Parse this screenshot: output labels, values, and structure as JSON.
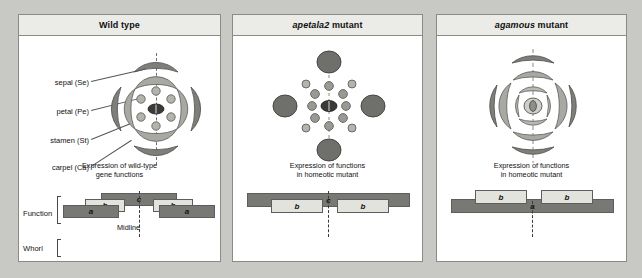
{
  "figure": {
    "background_color": "#c8c8c4",
    "panels": [
      {
        "id": "wild",
        "title_italic": "",
        "title_plain": "Wild type",
        "caption_line1": "Expression of wild-type",
        "caption_line2": "gene functions",
        "midline_label": "Midline",
        "row_labels": {
          "function": "Function",
          "whorl": "Whorl"
        },
        "organ_labels": [
          {
            "name": "sepal-label",
            "text": "sepal (Se)"
          },
          {
            "name": "petal-label",
            "text": "petal (Pe)"
          },
          {
            "name": "stamen-label",
            "text": "stamen (St)"
          },
          {
            "name": "carpel-label",
            "text": "carpel (Ca)"
          }
        ],
        "functions": [
          {
            "label": "a",
            "style": "dark"
          },
          {
            "label": "b",
            "style": "light"
          },
          {
            "label": "c",
            "style": "dark"
          },
          {
            "label": "b",
            "style": "light"
          },
          {
            "label": "a",
            "style": "dark"
          }
        ],
        "whorl_cells": [
          "Se",
          "Pe",
          "St",
          "Ca",
          "Ca",
          "St",
          "Pe",
          "Se"
        ],
        "whorl_numbers": [
          "1",
          "2",
          "3",
          "4",
          "4",
          "3",
          "2",
          "1"
        ]
      },
      {
        "id": "apetala2",
        "title_italic": "apetala2",
        "title_plain": "mutant",
        "caption_line1": "Expression of functions",
        "caption_line2": "in homeotic mutant",
        "midline_label": "",
        "row_labels": {
          "function": "",
          "whorl": ""
        },
        "organ_labels": [],
        "functions": [
          {
            "label": "b",
            "style": "light"
          },
          {
            "label": "c",
            "style": "dark"
          },
          {
            "label": "b",
            "style": "light"
          }
        ],
        "whorl_cells": [
          "Ca",
          "St",
          "St",
          "Ca",
          "Ca",
          "St",
          "St",
          "Ca"
        ],
        "whorl_numbers": [
          "1",
          "2",
          "3",
          "4",
          "4",
          "3",
          "2",
          "1"
        ]
      },
      {
        "id": "agamous",
        "title_italic": "agamous",
        "title_plain": "mutant",
        "caption_line1": "Expression of functions",
        "caption_line2": "in homeotic mutant",
        "midline_label": "",
        "row_labels": {
          "function": "",
          "whorl": ""
        },
        "organ_labels": [],
        "functions": [
          {
            "label": "b",
            "style": "light"
          },
          {
            "label": "a",
            "style": "dark"
          },
          {
            "label": "b",
            "style": "light"
          }
        ],
        "whorl_cells": [
          "Se",
          "Pe",
          "Pe",
          "Se",
          "Se",
          "Pe",
          "Pe",
          "Se"
        ],
        "whorl_numbers": [
          "1",
          "2",
          "3",
          "4",
          "4",
          "3",
          "2",
          "1"
        ]
      }
    ],
    "colors": {
      "sepal": "#7e7e7a",
      "petal": "#a9a9a4",
      "stamen": "#b4b4af",
      "carpel": "#3a3a38",
      "bar_dark": "#787874",
      "bar_light": "#e3e3de",
      "panel_bg": "#ffffff",
      "header_bg": "#ebebe8"
    }
  }
}
